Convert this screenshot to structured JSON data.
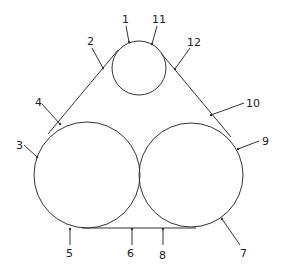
{
  "diagram": {
    "pulleys": [
      {
        "id": "top",
        "cx": 139,
        "cy": 68,
        "r": 27
      },
      {
        "id": "left",
        "cx": 87,
        "cy": 175,
        "r": 53
      },
      {
        "id": "right",
        "cx": 191,
        "cy": 175,
        "r": 52
      }
    ],
    "belt_segments": [
      {
        "id": "left-tangent",
        "x1": 118,
        "y1": 50,
        "x2": 48,
        "y2": 134
      },
      {
        "id": "right-tangent",
        "x1": 161,
        "y1": 53,
        "x2": 231,
        "y2": 137
      },
      {
        "id": "bottom-tangent",
        "x1": 82,
        "y1": 228,
        "x2": 196,
        "y2": 228
      }
    ],
    "labels": [
      {
        "text": "1",
        "x": 122,
        "y": 23,
        "lx1": 126,
        "ly1": 26,
        "lx2": 129,
        "ly2": 42
      },
      {
        "text": "11",
        "x": 152,
        "y": 23,
        "lx1": 157,
        "ly1": 26,
        "lx2": 152,
        "ly2": 44
      },
      {
        "text": "2",
        "x": 87,
        "y": 45,
        "lx1": 92,
        "ly1": 48,
        "lx2": 103,
        "ly2": 68
      },
      {
        "text": "12",
        "x": 187,
        "y": 46,
        "lx1": 190,
        "ly1": 48,
        "lx2": 175,
        "ly2": 69
      },
      {
        "text": "4",
        "x": 35,
        "y": 106,
        "lx1": 42,
        "ly1": 104,
        "lx2": 60,
        "ly2": 124
      },
      {
        "text": "10",
        "x": 246,
        "y": 107,
        "lx1": 244,
        "ly1": 103,
        "lx2": 211,
        "ly2": 115
      },
      {
        "text": "3",
        "x": 16,
        "y": 149,
        "lx1": 24,
        "ly1": 145,
        "lx2": 37,
        "ly2": 157
      },
      {
        "text": "9",
        "x": 262,
        "y": 145,
        "lx1": 259,
        "ly1": 141,
        "lx2": 238,
        "ly2": 149
      },
      {
        "text": "5",
        "x": 66,
        "y": 257,
        "lx1": 70,
        "ly1": 245,
        "lx2": 70,
        "ly2": 229
      },
      {
        "text": "6",
        "x": 127,
        "y": 257,
        "lx1": 132,
        "ly1": 245,
        "lx2": 132,
        "ly2": 229
      },
      {
        "text": "8",
        "x": 159,
        "y": 259,
        "lx1": 163,
        "ly1": 245,
        "lx2": 163,
        "ly2": 229
      },
      {
        "text": "7",
        "x": 240,
        "y": 257,
        "lx1": 240,
        "ly1": 245,
        "lx2": 222,
        "ly2": 219
      }
    ],
    "colors": {
      "line": "#333333",
      "text": "#222222",
      "background": "#ffffff"
    }
  }
}
